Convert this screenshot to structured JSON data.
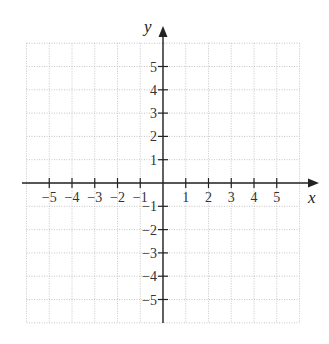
{
  "chart_data": {
    "type": "coordinate-plane",
    "title": "",
    "xlabel": "x",
    "ylabel": "y",
    "xlim": [
      -6,
      6
    ],
    "ylim": [
      -6,
      6
    ],
    "grid": true,
    "grid_style": "dotted",
    "x_ticks": [
      -5,
      -4,
      -3,
      -2,
      -1,
      1,
      2,
      3,
      4,
      5
    ],
    "y_ticks": [
      -5,
      -4,
      -3,
      -2,
      -1,
      1,
      2,
      3,
      4,
      5
    ],
    "x_tick_labels": [
      "−5",
      "−4",
      "−3",
      "−2",
      "−1",
      "1",
      "2",
      "3",
      "4",
      "5"
    ],
    "y_tick_labels": [
      "−5",
      "−4",
      "−3",
      "−2",
      "−1",
      "1",
      "2",
      "3",
      "4",
      "5"
    ],
    "series": []
  },
  "colors": {
    "axis": "#222222",
    "grid": "#b8b8b8",
    "background": "#ffffff"
  }
}
